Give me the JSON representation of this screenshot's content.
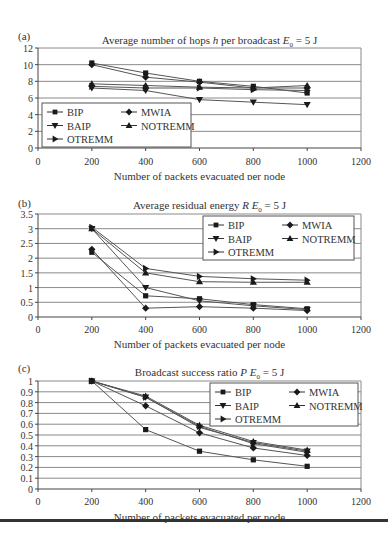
{
  "chart_data": [
    {
      "panel_label": "(a)",
      "type": "line",
      "title": "Average number of hops h per broadcast E0 = 5 J",
      "title_parts": {
        "pre": "Average number of hops ",
        "var": "h",
        "mid": " per broadcast ",
        "e": "E",
        "sub": "0",
        "post": " = 5 J"
      },
      "xlabel": "Number of packets evacuated per node",
      "ylabel": "",
      "x": [
        200,
        400,
        600,
        800,
        1000
      ],
      "xticks": [
        0,
        200,
        400,
        600,
        800,
        1000,
        1200
      ],
      "yticks": [
        "0",
        "2",
        "4",
        "6",
        "8",
        "10",
        "12"
      ],
      "xlim": [
        0,
        1200
      ],
      "ylim": [
        0,
        12
      ],
      "grid": true,
      "legend_position": "lower-left",
      "series": [
        {
          "name": "BIP",
          "marker": "square",
          "values": [
            10.2,
            9.0,
            8.0,
            7.4,
            6.6
          ]
        },
        {
          "name": "MWIA",
          "marker": "diamond",
          "values": [
            10.0,
            8.5,
            7.9,
            7.2,
            7.2
          ]
        },
        {
          "name": "BAIP",
          "marker": "triangle-down",
          "values": [
            7.2,
            6.9,
            5.8,
            5.5,
            5.2
          ]
        },
        {
          "name": "NOTREMM",
          "marker": "triangle-up",
          "values": [
            7.7,
            7.5,
            7.3,
            7.2,
            7.5
          ]
        },
        {
          "name": "OTREMM",
          "marker": "triangle-right",
          "values": [
            7.4,
            7.2,
            7.2,
            7.0,
            6.9
          ]
        }
      ]
    },
    {
      "panel_label": "(b)",
      "type": "line",
      "title": "Average residual energy R E0 = 5 J",
      "title_parts": {
        "pre": "Average residual energy ",
        "var": "R",
        "mid": " ",
        "e": "E",
        "sub": "0",
        "post": " = 5 J"
      },
      "xlabel": "Number of packets evacuated per node",
      "ylabel": "",
      "x": [
        200,
        400,
        600,
        800,
        1000
      ],
      "xticks": [
        0,
        200,
        400,
        600,
        800,
        1000,
        1200
      ],
      "yticks": [
        "0",
        "0.5",
        "1",
        "1.5",
        "2",
        "2.5",
        "3",
        "3.5"
      ],
      "xlim": [
        0,
        1200
      ],
      "ylim": [
        0,
        3.5
      ],
      "grid": true,
      "legend_position": "upper-right",
      "series": [
        {
          "name": "BIP",
          "marker": "square",
          "values": [
            2.2,
            0.72,
            0.62,
            0.42,
            0.28
          ]
        },
        {
          "name": "MWIA",
          "marker": "diamond",
          "values": [
            2.3,
            0.3,
            0.35,
            0.3,
            0.22
          ]
        },
        {
          "name": "BAIP",
          "marker": "triangle-down",
          "values": [
            3.0,
            1.0,
            0.55,
            0.38,
            0.25
          ]
        },
        {
          "name": "NOTREMM",
          "marker": "triangle-up",
          "values": [
            3.0,
            1.5,
            1.2,
            1.18,
            1.18
          ]
        },
        {
          "name": "OTREMM",
          "marker": "triangle-right",
          "values": [
            3.05,
            1.65,
            1.38,
            1.3,
            1.25
          ]
        }
      ]
    },
    {
      "panel_label": "(c)",
      "type": "line",
      "title": "Broadcast success ratio P E0 = 5 J",
      "title_parts": {
        "pre": "Broadcast success ratio ",
        "var": "P",
        "mid": " ",
        "e": "E",
        "sub": "0",
        "post": " = 5 J"
      },
      "xlabel": "Number of packets evacuated per node",
      "ylabel": "",
      "x": [
        200,
        400,
        600,
        800,
        1000
      ],
      "xticks": [
        0,
        200,
        400,
        600,
        800,
        1000,
        1200
      ],
      "yticks": [
        "0",
        "0.1",
        "0.2",
        "0.3",
        "0.4",
        "0.5",
        "0.6",
        "0.7",
        "0.8",
        "0.9",
        "1"
      ],
      "xlim": [
        0,
        1200
      ],
      "ylim": [
        0,
        1
      ],
      "grid": true,
      "legend_position": "upper-right",
      "series": [
        {
          "name": "BIP",
          "marker": "square",
          "values": [
            1.0,
            0.55,
            0.35,
            0.27,
            0.21
          ]
        },
        {
          "name": "MWIA",
          "marker": "diamond",
          "values": [
            1.0,
            0.77,
            0.52,
            0.38,
            0.31
          ]
        },
        {
          "name": "BAIP",
          "marker": "triangle-down",
          "values": [
            1.0,
            0.85,
            0.57,
            0.43,
            0.35
          ]
        },
        {
          "name": "NOTREMM",
          "marker": "triangle-up",
          "values": [
            1.0,
            0.86,
            0.59,
            0.44,
            0.36
          ]
        },
        {
          "name": "OTREMM",
          "marker": "triangle-right",
          "values": [
            1.0,
            0.85,
            0.58,
            0.42,
            0.34
          ]
        }
      ]
    }
  ],
  "legend_order": [
    "BIP",
    "MWIA",
    "BAIP",
    "NOTREMM",
    "OTREMM"
  ],
  "colors": {
    "line": "#555555",
    "marker": "#1a1a1a",
    "grid": "#8a8a8a",
    "axis": "#444444",
    "text": "#333333"
  }
}
